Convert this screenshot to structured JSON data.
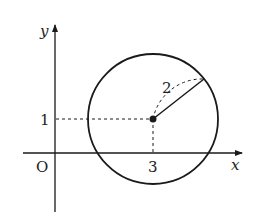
{
  "diagram": {
    "type": "circle-on-coordinate-plane",
    "axes": {
      "x_label": "x",
      "y_label": "y",
      "origin_label": "O"
    },
    "circle": {
      "center": [
        3,
        1
      ],
      "radius": 2,
      "radius_label": "2"
    },
    "ticks": {
      "x_tick_label": "3",
      "y_tick_label": "1"
    },
    "colors": {
      "stroke": "#1a1a1a",
      "background": "#ffffff"
    }
  }
}
